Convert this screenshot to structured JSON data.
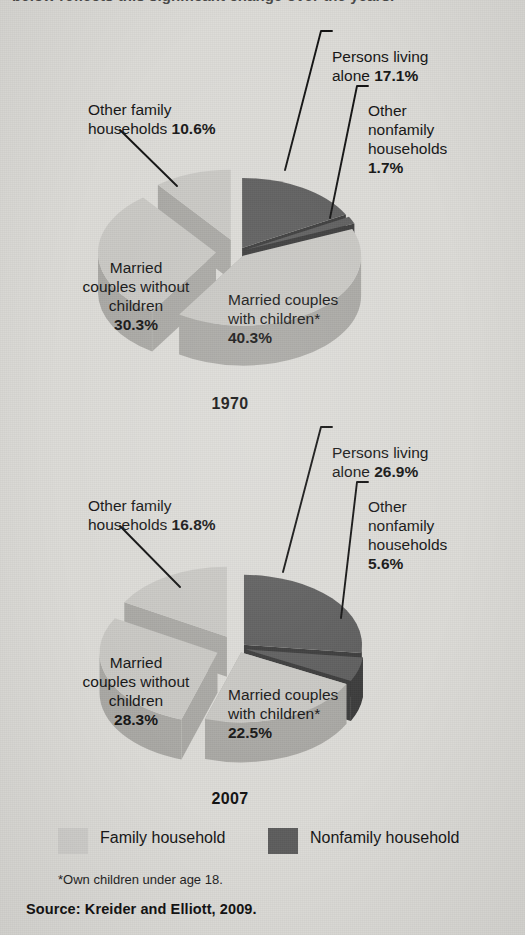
{
  "figure": {
    "cut_headline": "below reflects this significant change over the years.",
    "footnote": "*Own children under age 18.",
    "source": "Source: Kreider and Elliott, 2009."
  },
  "legend": {
    "items": [
      {
        "key": "family",
        "label": "Family household",
        "color": "#cfcecb"
      },
      {
        "key": "nonfamily",
        "label": "Nonfamily household",
        "color": "#5d5d5d"
      }
    ]
  },
  "colors": {
    "background": "#dcdbd7",
    "family_top": "#c9c8c4",
    "family_side": "#a9a8a4",
    "nonfamily_top": "#5d5d5d",
    "nonfamily_side": "#3a3a3a",
    "text": "#151515",
    "leader_line": "#111111"
  },
  "chart_data": [
    {
      "type": "pie",
      "title": "1970",
      "exploded": true,
      "three_d": true,
      "labels": [
        "Married couples with children*",
        "Married couples without children",
        "Other family households",
        "Persons living alone",
        "Other nonfamily households"
      ],
      "values": [
        40.3,
        30.3,
        10.6,
        17.1,
        1.7
      ],
      "units": "percent",
      "groups": [
        "family",
        "family",
        "family",
        "nonfamily",
        "nonfamily"
      ],
      "label_texts": {
        "persons_alone": "Persons living\nalone ",
        "persons_alone_value": "17.1%",
        "other_nonfamily": "Other\nnonfamily\nhouseholds\n",
        "other_nonfamily_value": "1.7%",
        "other_family": "Other family\nhouseholds ",
        "other_family_value": "10.6%",
        "without_children": "Married\ncouples without\nchildren\n",
        "without_children_value": "30.3%",
        "with_children": "Married couples\nwith children*\n",
        "with_children_value": "40.3%"
      }
    },
    {
      "type": "pie",
      "title": "2007",
      "exploded": true,
      "three_d": true,
      "labels": [
        "Married couples with children*",
        "Married couples without children",
        "Other family households",
        "Persons living alone",
        "Other nonfamily households"
      ],
      "values": [
        22.5,
        28.3,
        16.8,
        26.9,
        5.6
      ],
      "units": "percent",
      "groups": [
        "family",
        "family",
        "family",
        "nonfamily",
        "nonfamily"
      ],
      "label_texts": {
        "persons_alone": "Persons living\nalone ",
        "persons_alone_value": "26.9%",
        "other_nonfamily": "Other\nnonfamily\nhouseholds\n",
        "other_nonfamily_value": "5.6%",
        "other_family": "Other family\nhouseholds ",
        "other_family_value": "16.8%",
        "without_children": "Married\ncouples without\nchildren\n",
        "without_children_value": "28.3%",
        "with_children": "Married couples\nwith children*\n",
        "with_children_value": "22.5%"
      }
    }
  ]
}
